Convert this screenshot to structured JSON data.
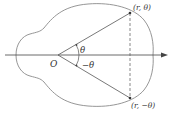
{
  "figure": {
    "origin_label": "O",
    "angle_label": "θ",
    "neg_angle_label": "−θ",
    "point_upper_label": "(r, θ)",
    "point_lower_label": "(r, −θ)",
    "colors": {
      "curve": "#8a8a8a",
      "lines": "#555555",
      "axis": "#444444",
      "text": "#333333",
      "background": "#ffffff"
    }
  }
}
